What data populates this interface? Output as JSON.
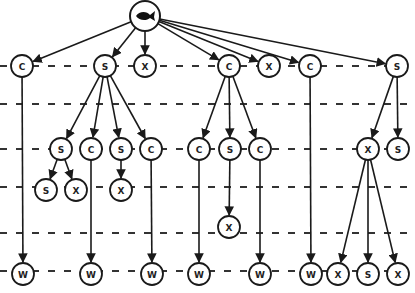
{
  "diagram": {
    "root": {
      "id": "root",
      "icon": "fish-icon",
      "x": 145,
      "y": 16,
      "r": 15
    },
    "levels_y": [
      66,
      104,
      149,
      187,
      233,
      271
    ],
    "node_radius": 11,
    "nodes": [
      {
        "id": "n1",
        "label": "C",
        "x": 22,
        "y": 66
      },
      {
        "id": "n2",
        "label": "S",
        "x": 105,
        "y": 66
      },
      {
        "id": "n3",
        "label": "X",
        "x": 145,
        "y": 66
      },
      {
        "id": "n4",
        "label": "C",
        "x": 229,
        "y": 66
      },
      {
        "id": "n5",
        "label": "X",
        "x": 269,
        "y": 66
      },
      {
        "id": "n6",
        "label": "C",
        "x": 310,
        "y": 66
      },
      {
        "id": "n7",
        "label": "S",
        "x": 397,
        "y": 66
      },
      {
        "id": "n8",
        "label": "S",
        "x": 61,
        "y": 149
      },
      {
        "id": "n9",
        "label": "C",
        "x": 91,
        "y": 149
      },
      {
        "id": "n10",
        "label": "S",
        "x": 121,
        "y": 149
      },
      {
        "id": "n11",
        "label": "C",
        "x": 151,
        "y": 149
      },
      {
        "id": "n12",
        "label": "C",
        "x": 199,
        "y": 149
      },
      {
        "id": "n13",
        "label": "S",
        "x": 230,
        "y": 149
      },
      {
        "id": "n14",
        "label": "C",
        "x": 260,
        "y": 149
      },
      {
        "id": "n15",
        "label": "X",
        "x": 368,
        "y": 149
      },
      {
        "id": "n16",
        "label": "S",
        "x": 398,
        "y": 149
      },
      {
        "id": "n17",
        "label": "S",
        "x": 46,
        "y": 190
      },
      {
        "id": "n18",
        "label": "X",
        "x": 76,
        "y": 190
      },
      {
        "id": "n19",
        "label": "X",
        "x": 121,
        "y": 190
      },
      {
        "id": "n20",
        "label": "X",
        "x": 229,
        "y": 227
      },
      {
        "id": "n21",
        "label": "W",
        "x": 23,
        "y": 274
      },
      {
        "id": "n22",
        "label": "W",
        "x": 91,
        "y": 274
      },
      {
        "id": "n23",
        "label": "W",
        "x": 152,
        "y": 274
      },
      {
        "id": "n24",
        "label": "W",
        "x": 199,
        "y": 274
      },
      {
        "id": "n25",
        "label": "W",
        "x": 260,
        "y": 274
      },
      {
        "id": "n26",
        "label": "W",
        "x": 311,
        "y": 274
      },
      {
        "id": "n27",
        "label": "X",
        "x": 338,
        "y": 274
      },
      {
        "id": "n28",
        "label": "S",
        "x": 368,
        "y": 274
      },
      {
        "id": "n29",
        "label": "X",
        "x": 398,
        "y": 274
      }
    ],
    "edges": [
      [
        "root",
        "n1"
      ],
      [
        "root",
        "n2"
      ],
      [
        "root",
        "n3"
      ],
      [
        "root",
        "n4"
      ],
      [
        "root",
        "n5"
      ],
      [
        "root",
        "n6"
      ],
      [
        "root",
        "n7"
      ],
      [
        "n1",
        "n21"
      ],
      [
        "n2",
        "n8"
      ],
      [
        "n2",
        "n9"
      ],
      [
        "n2",
        "n10"
      ],
      [
        "n2",
        "n11"
      ],
      [
        "n8",
        "n17"
      ],
      [
        "n8",
        "n18"
      ],
      [
        "n9",
        "n22"
      ],
      [
        "n10",
        "n19"
      ],
      [
        "n11",
        "n23"
      ],
      [
        "n4",
        "n12"
      ],
      [
        "n4",
        "n13"
      ],
      [
        "n4",
        "n14"
      ],
      [
        "n12",
        "n24"
      ],
      [
        "n13",
        "n20"
      ],
      [
        "n14",
        "n25"
      ],
      [
        "n6",
        "n26"
      ],
      [
        "n7",
        "n15"
      ],
      [
        "n7",
        "n16"
      ],
      [
        "n15",
        "n27"
      ],
      [
        "n15",
        "n28"
      ],
      [
        "n15",
        "n29"
      ]
    ],
    "colors": {
      "stroke": "#1a1a1a",
      "dash": "#333333",
      "fill": "#ffffff"
    }
  }
}
